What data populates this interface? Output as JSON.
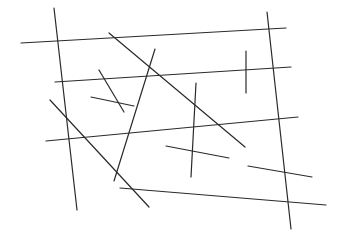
{
  "drawing": {
    "description": "Random straight line segments on white background",
    "line_color": "#2a2a2a",
    "background_color": "#ffffff",
    "segment_count": 15
  }
}
